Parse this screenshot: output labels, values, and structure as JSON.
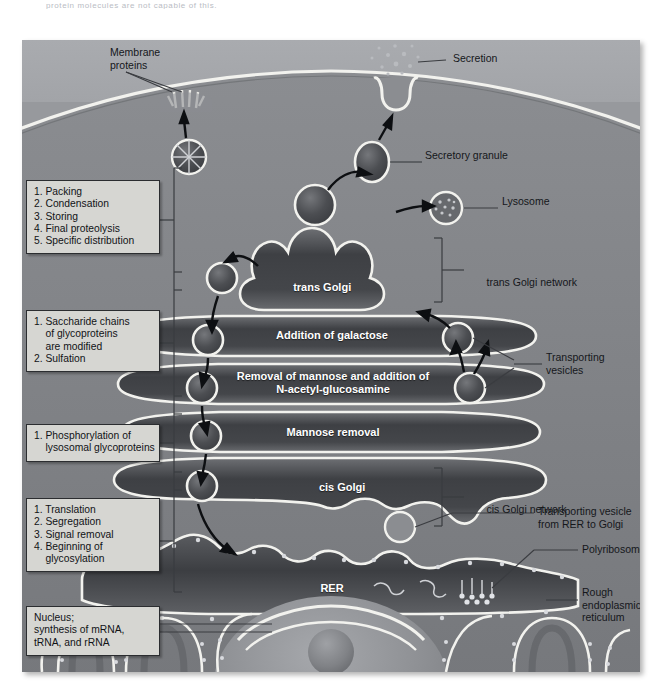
{
  "caption_fragment": "protein molecules are not capable of this.",
  "figure": {
    "background_color": "#8f9094",
    "extracellular_color": "#a9abaf",
    "membrane_color": "#f2f2ee",
    "organelle_fill": "#4a4c50"
  },
  "top_labels": [
    {
      "id": "membrane-proteins",
      "text": "Membrane\nproteins"
    },
    {
      "id": "secretion",
      "text": "Secretion"
    },
    {
      "id": "secretory-granule",
      "text": "Secretory granule"
    },
    {
      "id": "lysosome",
      "text": "Lysosome"
    }
  ],
  "golgi_stack": [
    {
      "id": "trans-golgi",
      "text": "trans Golgi",
      "italic_prefix": "trans",
      "rest": " Golgi"
    },
    {
      "id": "galactose",
      "text": "Addition of galactose"
    },
    {
      "id": "mannose-glcnac",
      "text": "Removal of mannose and addition of\nN-acetyl-glucosamine"
    },
    {
      "id": "mannose-removal",
      "text": "Mannose removal"
    },
    {
      "id": "cis-golgi",
      "text": "cis Golgi",
      "italic_prefix": "cis",
      "rest": " Golgi"
    },
    {
      "id": "rer",
      "text": "RER"
    }
  ],
  "right_labels": [
    {
      "id": "trans-golgi-network",
      "italic_prefix": "trans",
      "rest": " Golgi network"
    },
    {
      "id": "transporting-vesicles",
      "text": "Transporting\nvesicles"
    },
    {
      "id": "cis-golgi-network",
      "italic_prefix": "cis",
      "rest": " Golgi network"
    },
    {
      "id": "transporting-vesicle-rer",
      "text": "Transporting vesicle\nfrom RER to Golgi"
    },
    {
      "id": "polyribosome",
      "text": "Polyribosome"
    },
    {
      "id": "rough-er",
      "text": "Rough\nendoplasmic\nreticulum"
    }
  ],
  "callouts": [
    {
      "id": "callout-trans",
      "text": "1. Packing\n2. Condensation\n3. Storing\n4. Final proteolysis\n5. Specific distribution"
    },
    {
      "id": "callout-medial",
      "text": "1. Saccharide chains\n    of glycoproteins\n    are modified\n2. Sulfation"
    },
    {
      "id": "callout-cis",
      "text": "1. Phosphorylation of\n    lysosomal glycoproteins"
    },
    {
      "id": "callout-rer",
      "text": "1. Translation\n2. Segregation\n3. Signal removal\n4. Beginning of\n    glycosylation"
    },
    {
      "id": "callout-nucleus",
      "text": "Nucleus;\nsynthesis of mRNA,\ntRNA, and rRNA"
    }
  ]
}
